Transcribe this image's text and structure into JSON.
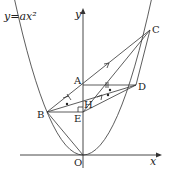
{
  "diagram": {
    "equation_label": "y=ax²",
    "axes": {
      "x_label": "x",
      "y_label": "y",
      "origin_label": "O"
    },
    "points": [
      {
        "name": "A",
        "x": 83,
        "y": 85
      },
      {
        "name": "B",
        "x": 47,
        "y": 112
      },
      {
        "name": "C",
        "x": 150,
        "y": 30
      },
      {
        "name": "D",
        "x": 136,
        "y": 85
      },
      {
        "name": "E",
        "x": 83,
        "y": 112
      },
      {
        "name": "H",
        "x": 88,
        "y": 102
      },
      {
        "name": "O",
        "x": 83,
        "y": 155
      }
    ],
    "segments": [
      "BC",
      "AD",
      "BD",
      "BE",
      "EC",
      "BO",
      "ED"
    ],
    "marks": {
      "parallel_arrows": [
        "BC",
        "EC"
      ],
      "equal_ticks": [
        "AD",
        "BA"
      ],
      "dots": [
        "angle-ABD",
        "angle-BDE"
      ],
      "right_angle": "E"
    },
    "colors": {
      "stroke": "#333333",
      "text": "#222222",
      "background": "#ffffff"
    }
  }
}
